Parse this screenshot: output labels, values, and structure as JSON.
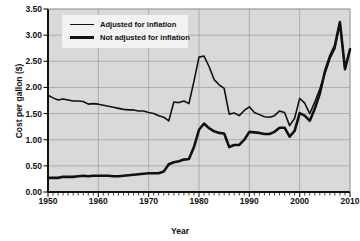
{
  "chart_data": {
    "type": "line",
    "title": "",
    "xlabel": "Year",
    "ylabel": "Cost per gallon ($)",
    "xlim": [
      1950,
      2010
    ],
    "ylim": [
      0.0,
      3.5
    ],
    "yticks": [
      "0.00",
      "0.50",
      "1.00",
      "1.50",
      "2.00",
      "2.50",
      "3.00",
      "3.50"
    ],
    "ytick_values": [
      0.0,
      0.5,
      1.0,
      1.5,
      2.0,
      2.5,
      3.0,
      3.5
    ],
    "xticks": [
      "1950",
      "1960",
      "1970",
      "1980",
      "1990",
      "2000",
      "2010"
    ],
    "xtick_values": [
      1950,
      1960,
      1970,
      1980,
      1990,
      2000,
      2010
    ],
    "minor_xtick_interval": 1,
    "grid": true,
    "grid_color": "#9a9a9a",
    "plot_background": "#d9d9d9",
    "line_color": "#111111",
    "legend_position": "top-left",
    "legend_background": "#f2f2f2",
    "x": [
      1950,
      1951,
      1952,
      1953,
      1954,
      1955,
      1956,
      1957,
      1958,
      1959,
      1960,
      1961,
      1962,
      1963,
      1964,
      1965,
      1966,
      1967,
      1968,
      1969,
      1970,
      1971,
      1972,
      1973,
      1974,
      1975,
      1976,
      1977,
      1978,
      1979,
      1980,
      1981,
      1982,
      1983,
      1984,
      1985,
      1986,
      1987,
      1988,
      1989,
      1990,
      1991,
      1992,
      1993,
      1994,
      1995,
      1996,
      1997,
      1998,
      1999,
      2000,
      2001,
      2002,
      2003,
      2004,
      2005,
      2006,
      2007,
      2008,
      2009,
      2010
    ],
    "series": [
      {
        "name": "Adjusted for inflation",
        "linewidth": 1.6,
        "values": [
          1.85,
          1.8,
          1.76,
          1.78,
          1.76,
          1.74,
          1.74,
          1.73,
          1.68,
          1.69,
          1.68,
          1.66,
          1.64,
          1.62,
          1.6,
          1.58,
          1.57,
          1.57,
          1.55,
          1.55,
          1.52,
          1.5,
          1.46,
          1.43,
          1.36,
          1.72,
          1.71,
          1.74,
          1.69,
          2.12,
          2.58,
          2.6,
          2.4,
          2.15,
          2.05,
          1.98,
          1.49,
          1.51,
          1.46,
          1.56,
          1.63,
          1.52,
          1.48,
          1.44,
          1.43,
          1.46,
          1.55,
          1.52,
          1.27,
          1.41,
          1.79,
          1.7,
          1.5,
          1.72,
          1.97,
          2.26,
          2.55,
          2.74,
          3.25,
          2.35,
          2.73
        ]
      },
      {
        "name": "Not adjusted for inflation",
        "linewidth": 2.6,
        "values": [
          0.27,
          0.27,
          0.27,
          0.29,
          0.29,
          0.29,
          0.3,
          0.31,
          0.3,
          0.31,
          0.31,
          0.31,
          0.31,
          0.3,
          0.3,
          0.31,
          0.32,
          0.33,
          0.34,
          0.35,
          0.36,
          0.36,
          0.36,
          0.39,
          0.53,
          0.57,
          0.59,
          0.62,
          0.63,
          0.86,
          1.19,
          1.31,
          1.22,
          1.16,
          1.13,
          1.12,
          0.86,
          0.9,
          0.9,
          1.0,
          1.15,
          1.14,
          1.13,
          1.11,
          1.11,
          1.15,
          1.23,
          1.23,
          1.06,
          1.17,
          1.51,
          1.46,
          1.36,
          1.59,
          1.88,
          2.3,
          2.59,
          2.8,
          3.25,
          2.35,
          2.73
        ]
      }
    ]
  },
  "legend": {
    "items": [
      {
        "label": "Adjusted for inflation"
      },
      {
        "label": "Not adjusted for inflation"
      }
    ]
  },
  "axes": {
    "x_title": "Year",
    "y_title": "Cost per gallon ($)"
  }
}
